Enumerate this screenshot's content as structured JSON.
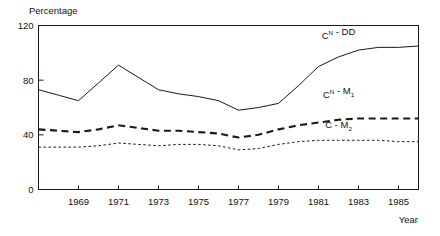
{
  "chart_data": {
    "type": "line",
    "title": "",
    "ylabel": "Percentage",
    "xlabel": "Year",
    "ylim": [
      0,
      120
    ],
    "yticks": [
      0,
      40,
      80,
      120
    ],
    "ytick_labels": [
      "0",
      "40",
      "80",
      "120"
    ],
    "xlim": [
      1967,
      1986
    ],
    "xticks": [
      1969,
      1971,
      1973,
      1975,
      1977,
      1979,
      1981,
      1983,
      1985
    ],
    "xtick_labels": [
      "1969",
      "1971",
      "1973",
      "1975",
      "1977",
      "1979",
      "1981",
      "1983",
      "1985"
    ],
    "grid": false,
    "legend": "inline-labels",
    "x": [
      1967,
      1968,
      1969,
      1970,
      1971,
      1972,
      1973,
      1974,
      1975,
      1976,
      1977,
      1978,
      1979,
      1980,
      1981,
      1982,
      1983,
      1984,
      1985,
      1986
    ],
    "series": [
      {
        "name": "CN - DD",
        "name_base": "C",
        "name_sup": "N",
        "name_rest": " - DD",
        "style": "solid",
        "label_x": 1982,
        "label_y": 110,
        "values": [
          73,
          69,
          65,
          78,
          91,
          82,
          73,
          70,
          68,
          65,
          58,
          60,
          63,
          76,
          90,
          97,
          102,
          104,
          104,
          105
        ]
      },
      {
        "name": "CN - M1",
        "name_base": "C",
        "name_sup": "N",
        "name_rest": " - M",
        "name_sub": "1",
        "style": "dashed",
        "label_x": 1982,
        "label_y": 67,
        "values": [
          44,
          43,
          42,
          44,
          47,
          45,
          43,
          43,
          42,
          41,
          38,
          40,
          44,
          47,
          49,
          51,
          52,
          52,
          52,
          52
        ]
      },
      {
        "name": "C - M2",
        "name_base": "C",
        "name_rest": " - M",
        "name_sub": "2",
        "style": "dotted",
        "label_x": 1982,
        "label_y": 45,
        "values": [
          31,
          31,
          31,
          32,
          34,
          33,
          32,
          33,
          33,
          32,
          29,
          30,
          33,
          35,
          36,
          36,
          36,
          36,
          35,
          35
        ]
      }
    ]
  }
}
